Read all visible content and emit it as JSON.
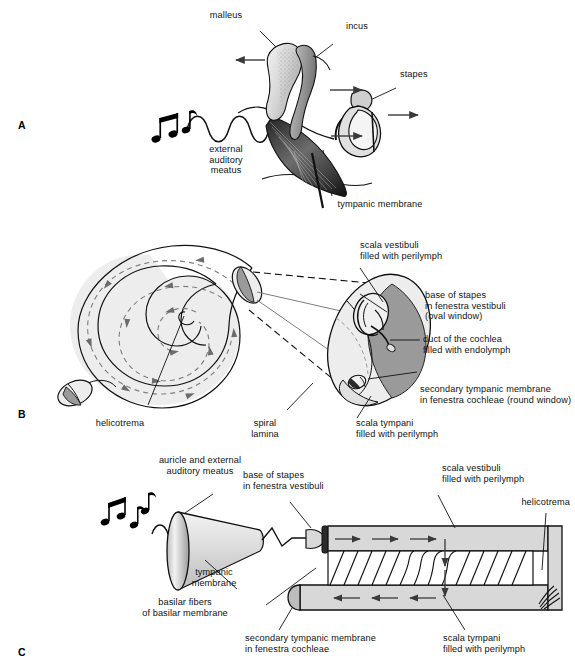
{
  "figure": {
    "background_color": "#ffffff",
    "ink_color": "#111111",
    "fill_light": "#e8e8e8",
    "fill_mid": "#c9c9c9",
    "fill_dark": "#9a9a9a",
    "width": 575,
    "height": 672
  },
  "panels": [
    {
      "letter": "A",
      "name": "middle-ear-ossicles",
      "labels": [
        {
          "key": "malleus",
          "text": "malleus"
        },
        {
          "key": "incus",
          "text": "incus"
        },
        {
          "key": "stapes",
          "text": "stapes"
        },
        {
          "key": "meatus",
          "text": "external\nauditory\nmeatus"
        },
        {
          "key": "tympanic",
          "text": "tympanic membrane"
        }
      ],
      "arrows": 4,
      "sound_notes": 2,
      "wave_cycles": 3.5
    },
    {
      "letter": "B",
      "name": "cochlea-spiral-and-cross-section",
      "labels": [
        {
          "key": "scala_vestibuli",
          "text": "scala vestibuli\nfilled with perilymph"
        },
        {
          "key": "base_of_stapes",
          "text": "base of stapes\nin fenestra vestibuli\n(oval window)"
        },
        {
          "key": "duct_of_cochlea",
          "text": "duct of the cochlea\nfilled with endolymph"
        },
        {
          "key": "secondary_tm",
          "text": "secondary tympanic membrane\nin fenestra cochleae (round window)"
        },
        {
          "key": "scala_tympani",
          "text": "scala tympani\nfilled with perilymph"
        },
        {
          "key": "helicotrema",
          "text": "helicotrema"
        },
        {
          "key": "spiral_lamina",
          "text": "spiral\nlamina"
        }
      ],
      "spiral_turns": 2.5
    },
    {
      "letter": "C",
      "name": "uncoiled-cochlea-schematic",
      "labels": [
        {
          "key": "auricle_meatus",
          "text": "auricle and external\nauditory meatus"
        },
        {
          "key": "base_of_stapes",
          "text": "base of stapes\nin fenestra vestibuli"
        },
        {
          "key": "scala_vestibuli",
          "text": "scala vestibuli\nfilled with perilymph"
        },
        {
          "key": "helicotrema",
          "text": "helicotrema"
        },
        {
          "key": "tympanic_membrane",
          "text": "tympanic\nmembrane"
        },
        {
          "key": "basilar_fibers",
          "text": "basilar fibers\nof basilar membrane"
        },
        {
          "key": "secondary_tm",
          "text": "secondary tympanic membrane\nin fenestra cochleae"
        },
        {
          "key": "scala_tympani",
          "text": "scala tympani\nfilled with perilymph"
        }
      ],
      "sound_notes": 3,
      "wave_cycles": 2.5,
      "basilar_fiber_count": 14
    }
  ]
}
